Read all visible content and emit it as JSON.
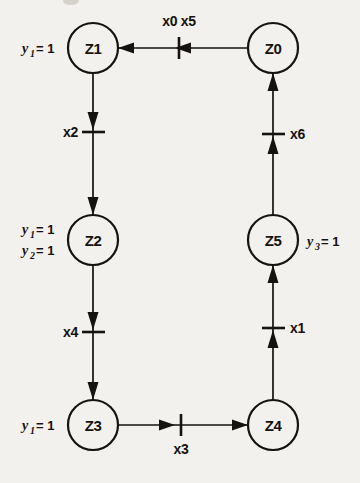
{
  "diagram": {
    "kind": "state-transition-graph",
    "background_color": "#f3f1ed",
    "ink_color": "#15120f",
    "states": [
      {
        "id": "Z0",
        "label": "Z0",
        "cx": 273,
        "cy": 48,
        "r": 25
      },
      {
        "id": "Z1",
        "label": "Z1",
        "cx": 93,
        "cy": 48,
        "r": 25
      },
      {
        "id": "Z2",
        "label": "Z2",
        "cx": 93,
        "cy": 240,
        "r": 25
      },
      {
        "id": "Z3",
        "label": "Z3",
        "cx": 93,
        "cy": 425,
        "r": 25
      },
      {
        "id": "Z4",
        "label": "Z4",
        "cx": 273,
        "cy": 425,
        "r": 25
      },
      {
        "id": "Z5",
        "label": "Z5",
        "cx": 273,
        "cy": 240,
        "r": 25
      }
    ],
    "transitions": [
      {
        "id": "t05",
        "label": "x0 x5",
        "from": "Z0",
        "to": "Z1",
        "orientation": "horizontal",
        "direction": "left",
        "label_pos": "above"
      },
      {
        "id": "t2",
        "label": "x2",
        "from": "Z1",
        "to": "Z2",
        "orientation": "vertical",
        "direction": "down",
        "label_pos": "left"
      },
      {
        "id": "t4",
        "label": "x4",
        "from": "Z2",
        "to": "Z3",
        "orientation": "vertical",
        "direction": "down",
        "label_pos": "left"
      },
      {
        "id": "t3",
        "label": "x3",
        "from": "Z3",
        "to": "Z4",
        "orientation": "horizontal",
        "direction": "right",
        "label_pos": "below"
      },
      {
        "id": "t1",
        "label": "x1",
        "from": "Z4",
        "to": "Z5",
        "orientation": "vertical",
        "direction": "up",
        "label_pos": "right"
      },
      {
        "id": "t6",
        "label": "x6",
        "from": "Z5",
        "to": "Z0",
        "orientation": "vertical",
        "direction": "up",
        "label_pos": "right"
      }
    ],
    "output_labels": [
      {
        "id": "o1",
        "state": "Z1",
        "var": "y",
        "sub": "1",
        "eq": "= 1",
        "text": "y1 = 1",
        "side": "left",
        "x": 14,
        "y": 53
      },
      {
        "id": "o2",
        "state": "Z2",
        "var": "y",
        "sub": "1",
        "eq": "= 1",
        "text": "y1 = 1",
        "side": "left",
        "x": 14,
        "y": 233
      },
      {
        "id": "o3",
        "state": "Z2",
        "var": "y",
        "sub": "2",
        "eq": "= 1",
        "text": "y2 = 1",
        "side": "left",
        "x": 14,
        "y": 254
      },
      {
        "id": "o4",
        "state": "Z3",
        "var": "y",
        "sub": "1",
        "eq": "= 1",
        "text": "y1 = 1",
        "side": "left",
        "x": 14,
        "y": 430
      },
      {
        "id": "o5",
        "state": "Z5",
        "var": "y",
        "sub": "3",
        "eq": "= 1",
        "text": "y3 = 1",
        "side": "right",
        "x": 307,
        "y": 245
      }
    ]
  }
}
